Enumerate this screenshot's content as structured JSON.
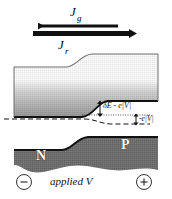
{
  "figure": {
    "type": "semiconductor-band-diagram"
  },
  "currents": {
    "generation": {
      "symbol": "J",
      "subscript": "g",
      "direction": "left",
      "x_start": 33,
      "x_end": 118,
      "y": 26,
      "thickness": 3
    },
    "recombination": {
      "symbol": "J",
      "subscript": "r",
      "direction": "right",
      "x_start": 33,
      "x_end": 139,
      "y": 33,
      "thickness": 5
    }
  },
  "bands": {
    "conduction": {
      "label": "conduction-band",
      "left_top_y": 67,
      "right_top_y": 54,
      "left_bottom_y": 117,
      "right_bottom_y": 101
    },
    "valence": {
      "label": "valence-band",
      "left_top_y": 150,
      "right_top_y": 137
    }
  },
  "levels": {
    "fermi_n": {
      "style": "dashed",
      "y": 119
    },
    "fermi_p": {
      "style": "dotted",
      "y": 115
    }
  },
  "annotations": {
    "energy_gap": "δE - e|V|",
    "bias_offset": "-e|V|"
  },
  "regions": {
    "n_label": "N",
    "p_label": "P"
  },
  "bias": {
    "negative_terminal": "−",
    "positive_terminal": "+",
    "caption": "applied V"
  },
  "colors": {
    "band_fill_dark": "#8c8c8c",
    "band_fill_light": "#ffffff",
    "outline": "#000000",
    "valence_fill": "#7a7a7a"
  }
}
